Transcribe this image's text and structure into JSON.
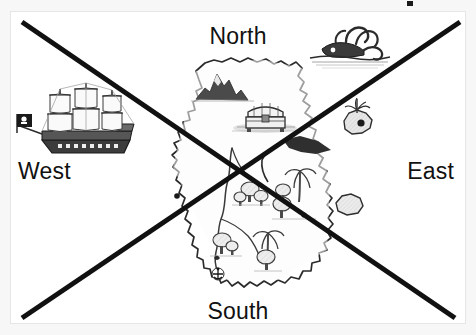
{
  "image": {
    "title": "Pirate treasure map with compass direction labels and a large X overlay",
    "width": 476,
    "height": 335,
    "background_color": "#f7f7f7",
    "card_color": "#ffffff",
    "ink_color": "#1a1a1a"
  },
  "compass": {
    "north": "North",
    "south": "South",
    "west": "West",
    "east": "East"
  },
  "overlay": {
    "type": "x-cross",
    "color": "#111111",
    "stroke_width": 5,
    "lines": [
      {
        "name": "diagonal-nw-se",
        "x1": 22,
        "y1": 22,
        "x2": 455,
        "y2": 318
      },
      {
        "name": "diagonal-sw-ne",
        "x1": 22,
        "y1": 318,
        "x2": 460,
        "y2": 22
      }
    ]
  },
  "map_features": [
    {
      "id": "pirate-ship",
      "label": "Pirate ship with skull flag",
      "x": 75,
      "y": 118
    },
    {
      "id": "sea-monster",
      "label": "Kraken sea monster",
      "x": 348,
      "y": 44
    },
    {
      "id": "mountain",
      "label": "Mountain range",
      "x": 215,
      "y": 86
    },
    {
      "id": "treasure-chest",
      "label": "Treasure chest",
      "x": 265,
      "y": 118
    },
    {
      "id": "palm-islet",
      "label": "Small palm island",
      "x": 358,
      "y": 120
    },
    {
      "id": "rock-islet",
      "label": "Rock islet",
      "x": 350,
      "y": 207
    },
    {
      "id": "forest-north",
      "label": "Forest trees",
      "x": 250,
      "y": 195
    },
    {
      "id": "forest-west",
      "label": "Forest trees",
      "x": 222,
      "y": 245
    },
    {
      "id": "palm-grove",
      "label": "Palm grove",
      "x": 300,
      "y": 200
    },
    {
      "id": "palm-south",
      "label": "Palm tree",
      "x": 268,
      "y": 245
    },
    {
      "id": "anchor-mark",
      "label": "Anchor marker",
      "x": 218,
      "y": 274
    },
    {
      "id": "river",
      "label": "River running south",
      "x": 230,
      "y": 200
    },
    {
      "id": "lagoon",
      "label": "Dark lagoon inlet",
      "x": 298,
      "y": 148
    }
  ],
  "artifact": {
    "name": "scan-speck",
    "x": 407,
    "y": 1
  }
}
